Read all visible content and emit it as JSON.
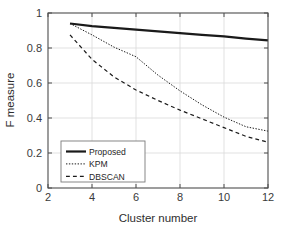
{
  "chart_data": {
    "type": "line",
    "title": "",
    "xlabel": "Cluster number",
    "ylabel": "F measure",
    "xlim": [
      2,
      12
    ],
    "ylim": [
      0,
      1
    ],
    "xticks": [
      2,
      4,
      6,
      8,
      10,
      12
    ],
    "yticks": [
      0,
      0.2,
      0.4,
      0.6,
      0.8,
      1
    ],
    "xticklabels": [
      "2",
      "4",
      "6",
      "8",
      "10",
      "12"
    ],
    "yticklabels": [
      "0",
      "0.2",
      "0.4",
      "0.6",
      "0.8",
      "1"
    ],
    "grid": true,
    "legend_position": "lower left",
    "x": [
      3,
      4,
      5,
      6,
      7,
      8,
      9,
      10,
      11,
      12
    ],
    "series": [
      {
        "name": "Proposed",
        "style": "solid",
        "width": 2.2,
        "color": "#1a1a1a",
        "values": [
          0.94,
          0.925,
          0.915,
          0.905,
          0.895,
          0.885,
          0.875,
          0.866,
          0.854,
          0.843
        ]
      },
      {
        "name": "KPM",
        "style": "dotted",
        "width": 1.0,
        "color": "#1a1a1a",
        "values": [
          0.94,
          0.875,
          0.805,
          0.75,
          0.645,
          0.555,
          0.475,
          0.405,
          0.35,
          0.325
        ]
      },
      {
        "name": "DBSCAN",
        "style": "dashed",
        "width": 1.2,
        "color": "#1a1a1a",
        "values": [
          0.875,
          0.735,
          0.635,
          0.56,
          0.5,
          0.445,
          0.395,
          0.345,
          0.295,
          0.262
        ]
      }
    ],
    "legend_entries": [
      {
        "label": "Proposed",
        "style": "solid"
      },
      {
        "label": "KPM",
        "style": "dotted"
      },
      {
        "label": "DBSCAN",
        "style": "dashed"
      }
    ],
    "colors": {
      "axis": "#4d4d4d",
      "grid": "#d9d9d9",
      "line": "#1a1a1a",
      "background": "#ffffff",
      "text": "#2e2e2e"
    }
  }
}
